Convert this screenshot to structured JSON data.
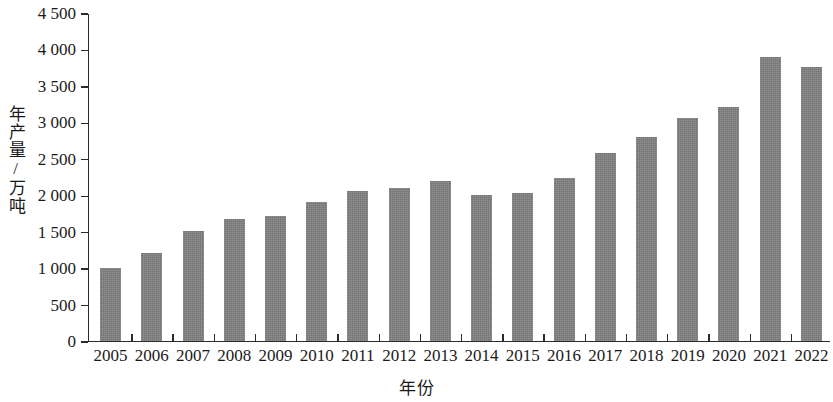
{
  "chart_data": {
    "type": "bar",
    "title": "",
    "xlabel": "年份",
    "ylabel": "年产量/万吨",
    "categories": [
      "2005",
      "2006",
      "2007",
      "2008",
      "2009",
      "2010",
      "2011",
      "2012",
      "2013",
      "2014",
      "2015",
      "2016",
      "2017",
      "2018",
      "2019",
      "2020",
      "2021",
      "2022"
    ],
    "values": [
      1000,
      1200,
      1510,
      1670,
      1710,
      1900,
      2050,
      2100,
      2190,
      2000,
      2030,
      2230,
      2580,
      2790,
      3060,
      3200,
      3890,
      3760
    ],
    "ylim": [
      0,
      4500
    ],
    "ytick_values": [
      0,
      500,
      1000,
      1500,
      2000,
      2500,
      3000,
      3500,
      4000,
      4500
    ],
    "ytick_labels": [
      "0",
      "500",
      "1 000",
      "1 500",
      "2 000",
      "2 500",
      "3 000",
      "3 500",
      "4 000",
      "4 500"
    ],
    "grid": false,
    "legend": false,
    "bar_color": "#818181",
    "axis_color": "#2b2b2b",
    "text_color": "#1a1a1a"
  }
}
